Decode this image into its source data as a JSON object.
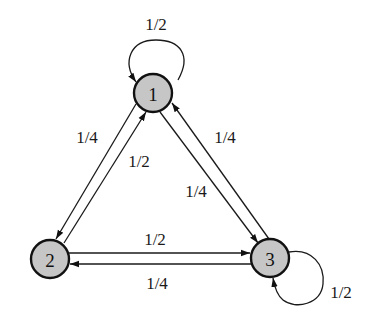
{
  "diagram": {
    "type": "markov-chain-state-diagram",
    "colors": {
      "node_fill": "#c6c6c6",
      "node_stroke": "#111111",
      "edge": "#1a1a1a",
      "background": "#ffffff"
    },
    "nodes": [
      {
        "id": "1",
        "label": "1",
        "x": 153,
        "y": 93
      },
      {
        "id": "2",
        "label": "2",
        "x": 50,
        "y": 259
      },
      {
        "id": "3",
        "label": "3",
        "x": 270,
        "y": 258
      }
    ],
    "edges": [
      {
        "from": "1",
        "to": "1",
        "label": "1/2",
        "kind": "self-loop"
      },
      {
        "from": "1",
        "to": "2",
        "label": "1/4"
      },
      {
        "from": "2",
        "to": "1",
        "label": "1/2"
      },
      {
        "from": "3",
        "to": "1",
        "label": "1/4"
      },
      {
        "from": "1",
        "to": "3",
        "label": "1/4"
      },
      {
        "from": "2",
        "to": "3",
        "label": "1/2"
      },
      {
        "from": "3",
        "to": "2",
        "label": "1/4"
      },
      {
        "from": "3",
        "to": "3",
        "label": "1/2",
        "kind": "self-loop"
      }
    ]
  }
}
